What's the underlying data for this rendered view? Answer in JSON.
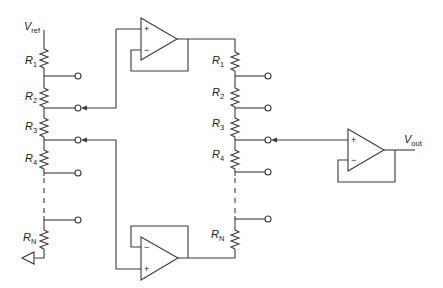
{
  "diagram": {
    "left_ladder": {
      "supply_label": "V",
      "supply_sub": "ref",
      "resistors": [
        {
          "name": "R",
          "sub": "1"
        },
        {
          "name": "R",
          "sub": "2"
        },
        {
          "name": "R",
          "sub": "3"
        },
        {
          "name": "R",
          "sub": "4"
        },
        {
          "name": "R",
          "sub": "N"
        }
      ],
      "ground": "ground-symbol"
    },
    "right_ladder": {
      "resistors": [
        {
          "name": "R",
          "sub": "1"
        },
        {
          "name": "R",
          "sub": "2"
        },
        {
          "name": "R",
          "sub": "3"
        },
        {
          "name": "R",
          "sub": "4"
        },
        {
          "name": "R",
          "sub": "N"
        }
      ]
    },
    "opamps": {
      "top": {
        "plus": "+",
        "minus": "−"
      },
      "bottom": {
        "plus": "+",
        "minus": "−"
      },
      "output": {
        "plus": "+",
        "minus": "−"
      }
    },
    "output_label": "V",
    "output_sub": "out",
    "colors": {
      "line": "#3a3a3a",
      "background": "#ffffff"
    }
  }
}
